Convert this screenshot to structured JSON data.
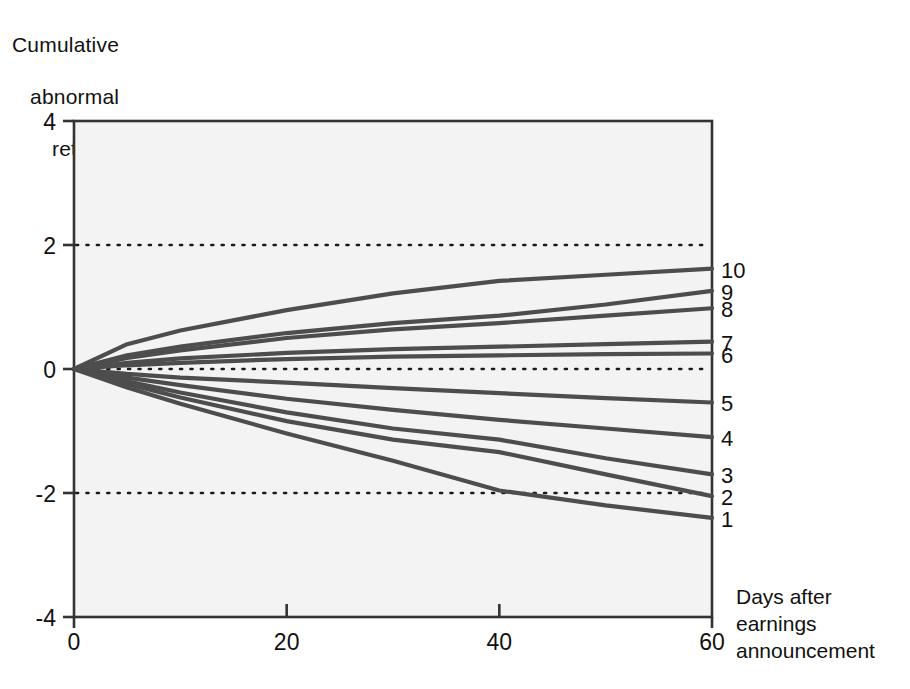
{
  "chart_data": {
    "type": "line",
    "title": "",
    "ylabel": "Cumulative abnormal return",
    "ylabel_lines": [
      "Cumulative",
      "abnormal",
      "return"
    ],
    "xlabel": "Days after earnings announcement",
    "xlabel_lines": [
      "Days after",
      "earnings",
      "announcement"
    ],
    "xlim": [
      0,
      60
    ],
    "ylim": [
      -4,
      4
    ],
    "xticks": [
      0,
      20,
      40,
      60
    ],
    "xtick_labels": [
      "0",
      "20",
      "40",
      "60"
    ],
    "yticks": [
      4,
      2,
      0,
      -2,
      -4
    ],
    "ytick_labels": [
      "4",
      "2",
      "0",
      "-2",
      "-4"
    ],
    "grid": "horizontal-dotted",
    "gridlines": [
      2,
      0,
      -2
    ],
    "legend_position": "right-end-labels",
    "line_color": "#4d4d4d",
    "plot_bg": "#f3f3f3",
    "axis_color": "#333333",
    "x": [
      0,
      5,
      10,
      20,
      30,
      40,
      50,
      60
    ],
    "series": [
      {
        "name": "10",
        "label": "10",
        "values": [
          0.0,
          0.4,
          0.62,
          0.95,
          1.22,
          1.42,
          1.52,
          1.62
        ]
      },
      {
        "name": "9",
        "label": "9",
        "values": [
          0.0,
          0.22,
          0.36,
          0.58,
          0.74,
          0.86,
          1.04,
          1.26
        ]
      },
      {
        "name": "8",
        "label": "8",
        "values": [
          0.0,
          0.18,
          0.3,
          0.5,
          0.64,
          0.74,
          0.86,
          0.98
        ]
      },
      {
        "name": "7",
        "label": "7",
        "values": [
          0.0,
          0.1,
          0.17,
          0.26,
          0.32,
          0.36,
          0.4,
          0.44
        ]
      },
      {
        "name": "6",
        "label": "6",
        "values": [
          0.0,
          0.06,
          0.1,
          0.16,
          0.2,
          0.22,
          0.24,
          0.25
        ]
      },
      {
        "name": "5",
        "label": "5",
        "values": [
          0.0,
          -0.08,
          -0.14,
          -0.22,
          -0.31,
          -0.39,
          -0.47,
          -0.54
        ]
      },
      {
        "name": "4",
        "label": "4",
        "values": [
          0.0,
          -0.14,
          -0.26,
          -0.48,
          -0.66,
          -0.82,
          -0.96,
          -1.1
        ]
      },
      {
        "name": "3",
        "label": "3",
        "values": [
          0.0,
          -0.2,
          -0.38,
          -0.7,
          -0.96,
          -1.14,
          -1.44,
          -1.7
        ]
      },
      {
        "name": "2",
        "label": "2",
        "values": [
          0.0,
          -0.24,
          -0.46,
          -0.84,
          -1.14,
          -1.34,
          -1.7,
          -2.05
        ]
      },
      {
        "name": "1",
        "label": "1",
        "values": [
          0.0,
          -0.3,
          -0.56,
          -1.04,
          -1.48,
          -1.96,
          -2.2,
          -2.4
        ]
      }
    ]
  }
}
